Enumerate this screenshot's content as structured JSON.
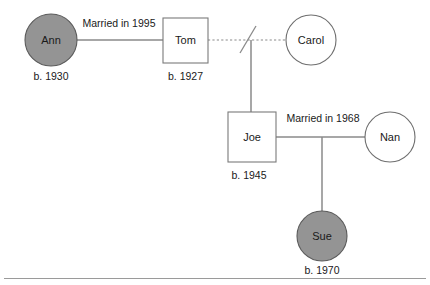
{
  "diagram": {
    "type": "genogram",
    "background_color": "#ffffff",
    "line_color": "#8a8a8a",
    "filled_fill_color": "#949494",
    "open_fill_color": "#ffffff",
    "text_color": "#1a1a1a"
  },
  "people": {
    "ann": {
      "name": "Ann",
      "birth": "b. 1930",
      "shape": "circle",
      "fill": "filled"
    },
    "tom": {
      "name": "Tom",
      "birth": "b. 1927",
      "shape": "square",
      "fill": "open"
    },
    "carol": {
      "name": "Carol",
      "birth": "",
      "shape": "circle",
      "fill": "open"
    },
    "joe": {
      "name": "Joe",
      "birth": "b. 1945",
      "shape": "square",
      "fill": "open"
    },
    "nan": {
      "name": "Nan",
      "birth": "",
      "shape": "circle",
      "fill": "open"
    },
    "sue": {
      "name": "Sue",
      "birth": "b. 1970",
      "shape": "circle",
      "fill": "filled"
    }
  },
  "relationships": {
    "ann_tom": {
      "label": "Married in 1995",
      "style": "solid"
    },
    "tom_carol": {
      "label": "",
      "style": "dashed-divorced"
    },
    "joe_nan": {
      "label": "Married in 1968",
      "style": "solid"
    }
  },
  "descent": {
    "tom_carol_to_joe": "child-line",
    "joe_nan_to_sue": "child-line"
  }
}
